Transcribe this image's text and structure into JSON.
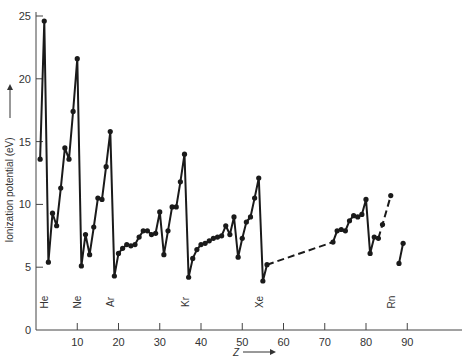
{
  "chart_data": {
    "type": "line",
    "title": "",
    "xlabel": "Z",
    "ylabel": "Ionization potential (eV)",
    "xlim": [
      0,
      100
    ],
    "ylim": [
      0,
      25
    ],
    "grid": false,
    "x_ticks": [
      10,
      20,
      30,
      40,
      50,
      60,
      70,
      80,
      90
    ],
    "y_ticks": [
      0,
      5,
      10,
      15,
      20,
      25
    ],
    "noble_gas_labels": [
      {
        "label": "He",
        "z": 2
      },
      {
        "label": "Ne",
        "z": 10
      },
      {
        "label": "Ar",
        "z": 18
      },
      {
        "label": "Kr",
        "z": 36
      },
      {
        "label": "Xe",
        "z": 54
      },
      {
        "label": "Rn",
        "z": 86
      }
    ],
    "series": [
      {
        "name": "Z1-56",
        "style": "solid",
        "x": [
          1,
          2,
          3,
          4,
          5,
          6,
          7,
          8,
          9,
          10,
          11,
          12,
          13,
          14,
          15,
          16,
          17,
          18,
          19,
          20,
          21,
          22,
          23,
          24,
          25,
          26,
          27,
          28,
          29,
          30,
          31,
          32,
          33,
          34,
          35,
          36,
          37,
          38,
          39,
          40,
          41,
          42,
          43,
          44,
          45,
          46,
          47,
          48,
          49,
          50,
          51,
          52,
          53,
          54,
          55,
          56
        ],
        "values": [
          13.6,
          24.6,
          5.4,
          9.3,
          8.3,
          11.3,
          14.5,
          13.6,
          17.4,
          21.6,
          5.1,
          7.6,
          6.0,
          8.2,
          10.5,
          10.4,
          13.0,
          15.8,
          4.3,
          6.1,
          6.5,
          6.8,
          6.7,
          6.8,
          7.4,
          7.9,
          7.9,
          7.6,
          7.7,
          9.4,
          6.0,
          7.9,
          9.8,
          9.8,
          11.8,
          14.0,
          4.2,
          5.7,
          6.4,
          6.8,
          6.9,
          7.1,
          7.3,
          7.4,
          7.5,
          8.3,
          7.6,
          9.0,
          5.8,
          7.3,
          8.6,
          9.0,
          10.5,
          12.1,
          3.9,
          5.2
        ]
      },
      {
        "name": "Z56-72 gap",
        "style": "dashed",
        "x": [
          56,
          72
        ],
        "values": [
          5.2,
          7.0
        ]
      },
      {
        "name": "Z72-83",
        "style": "solid",
        "x": [
          72,
          73,
          74,
          75,
          76,
          77,
          78,
          79,
          80,
          81,
          82,
          83
        ],
        "values": [
          7.0,
          7.9,
          8.0,
          7.9,
          8.7,
          9.1,
          9.0,
          9.2,
          10.4,
          6.1,
          7.4,
          7.3
        ]
      },
      {
        "name": "Z83-86 gap",
        "style": "dashed",
        "x": [
          83,
          84,
          86
        ],
        "values": [
          7.3,
          8.4,
          10.7
        ]
      },
      {
        "name": "Z88-89",
        "style": "solid",
        "x": [
          88,
          89
        ],
        "values": [
          5.3,
          6.9
        ]
      }
    ]
  }
}
